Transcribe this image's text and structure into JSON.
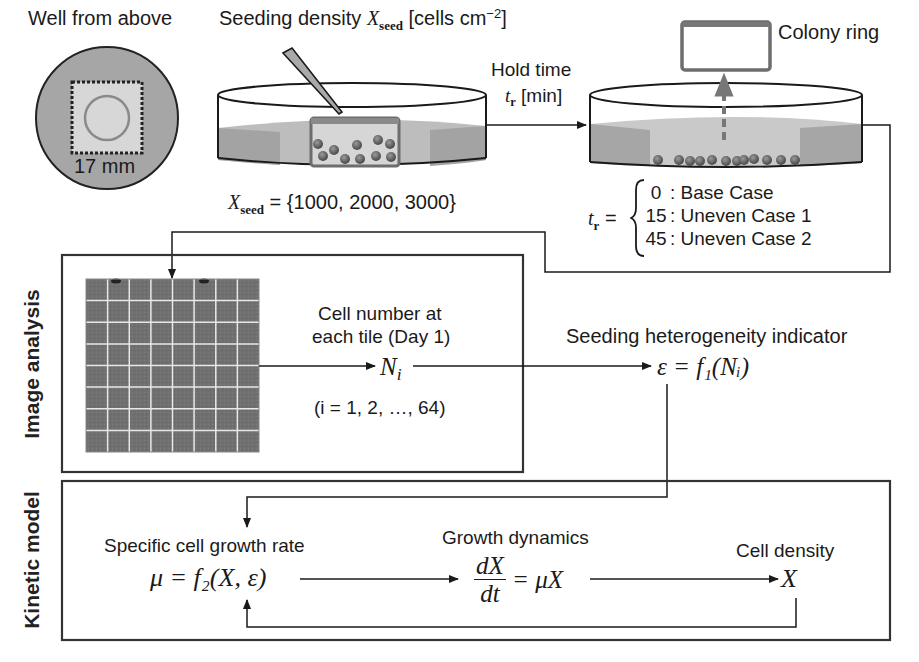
{
  "top": {
    "well_label": "Well from above",
    "well_dimension": "17 mm",
    "seeding_label_prefix": "Seeding density ",
    "seeding_symbol": "X",
    "seeding_symbol_sub": "seed",
    "seeding_unit": "[cells cm",
    "seeding_unit_exp": "−2",
    "seeding_unit_close": "]",
    "seeding_values_symbol": "X",
    "seeding_values_sub": "seed",
    "seeding_values": " = {1000, 2000, 3000}",
    "hold_time_label": "Hold time",
    "hold_time_symbol": "t",
    "hold_time_sub": "r",
    "hold_time_unit": " [min]",
    "colony_ring_label": "Colony ring",
    "cases_symbol": "t",
    "cases_sub": "r",
    "cases_eq": " =",
    "cases": [
      {
        "value": "0",
        "name": ": Base Case"
      },
      {
        "value": "15",
        "name": ": Uneven Case 1"
      },
      {
        "value": "45",
        "name": ": Uneven Case 2"
      }
    ]
  },
  "image_analysis": {
    "section_label": "Image analysis",
    "grid_rows": 8,
    "grid_cols": 8,
    "cell_number_line1": "Cell number at",
    "cell_number_line2": "each tile (Day 1)",
    "ni_symbol": "N",
    "ni_sub": "i",
    "index_range": "(i = 1, 2, …, 64)",
    "indicator_label": "Seeding heterogeneity indicator",
    "indicator_formula": "ε = f₁(Nᵢ)"
  },
  "kinetic_model": {
    "section_label": "Kinetic model",
    "growth_rate_label": "Specific cell growth rate",
    "growth_rate_formula": "μ = f₂(X, ε)",
    "dynamics_label": "Growth dynamics",
    "dynamics_num": "dX",
    "dynamics_den": "dt",
    "dynamics_rhs": " = μX",
    "density_label": "Cell density",
    "density_symbol": "X"
  },
  "colors": {
    "line": "#1a1a1a",
    "medium_gray": "#9a9a9a",
    "light_gray": "#d4d4d4",
    "tile_dark": "#6e6e6e",
    "cell_fill": "#6a6a6a"
  }
}
